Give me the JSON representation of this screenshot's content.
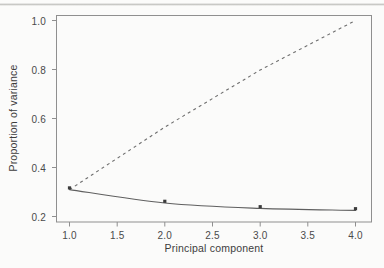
{
  "figure": {
    "background_color": "#fbfbfa",
    "ink_color": "#555555",
    "frame_color": "#8c8c8c",
    "has_scan_artifact": true
  },
  "chart_data": {
    "type": "line",
    "title": "",
    "subtitle": "",
    "xlabel": "Principal component",
    "ylabel": "Proportion of variance",
    "x": [
      1.0,
      2.0,
      3.0,
      4.0
    ],
    "xlim": [
      0.75,
      4.25
    ],
    "ylim": [
      0.17,
      1.04
    ],
    "grid": false,
    "legend": null,
    "xticks": [
      1.0,
      1.5,
      2.0,
      2.5,
      3.0,
      3.5,
      4.0
    ],
    "xtick_labels": [
      "1.0",
      "1.5",
      "2.0",
      "2.5",
      "3.0",
      "3.5",
      "4.0"
    ],
    "yticks": [
      0.2,
      0.4,
      0.6,
      0.8,
      1.0
    ],
    "ytick_labels": [
      "0.2",
      "0.4",
      "0.6",
      "0.8",
      "1.0"
    ],
    "series": [
      {
        "name": "proportion-of-variance",
        "style": "solid",
        "markers": "point",
        "values": [
          0.31,
          0.255,
          0.233,
          0.225
        ]
      },
      {
        "name": "cumulative-proportion-of-variance",
        "style": "dashed",
        "markers": "none",
        "values": [
          0.31,
          0.565,
          0.798,
          1.0
        ]
      }
    ],
    "annotations": []
  }
}
